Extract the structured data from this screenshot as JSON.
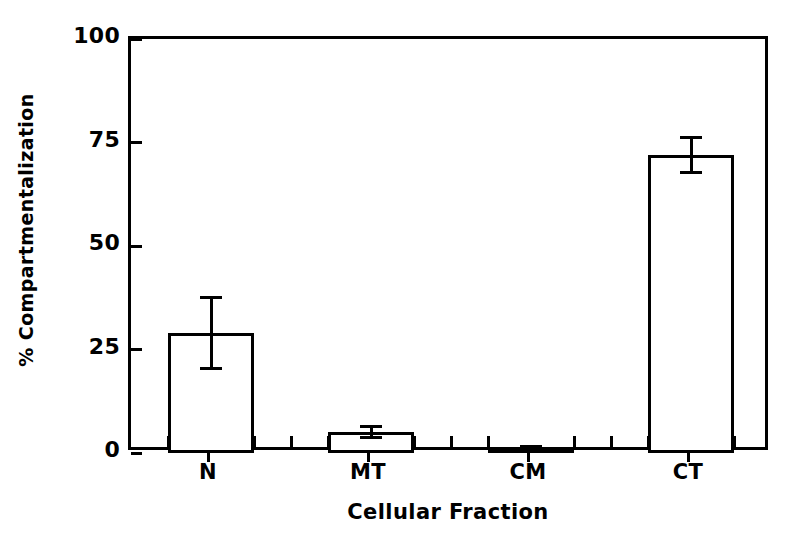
{
  "chart_data": {
    "type": "bar",
    "title": "",
    "subtitle": "",
    "xlabel": "Cellular Fraction",
    "ylabel": "% Compartmentalization",
    "categories": [
      "N",
      "MT",
      "CM",
      "CT"
    ],
    "values": [
      29,
      5,
      1.4,
      72
    ],
    "errors": [
      9,
      1.7,
      0.5,
      4.5
    ],
    "error_type": "symmetric",
    "ylim": [
      0,
      100
    ],
    "yticks": [
      0,
      25,
      50,
      75,
      100
    ],
    "ytick_labels": [
      "0",
      "25",
      "50",
      "75",
      "100"
    ],
    "xtick_labels": [
      "N",
      "MT",
      "CM",
      "CT"
    ],
    "grid": false,
    "legend": false,
    "legend_position": "none",
    "bar_fill": "#ffffff",
    "bar_edge": "#000000",
    "background": "#ffffff",
    "axis_color": "#000000",
    "series": [
      {
        "name": "Compartmentalization",
        "values": [
          29,
          5,
          1.4,
          72
        ],
        "errors": [
          9,
          1.7,
          0.5,
          4.5
        ]
      }
    ]
  },
  "axes": {
    "y": {
      "title": "% Compartmentalization",
      "ticks": [
        {
          "label": "100",
          "value": 100
        },
        {
          "label": "75",
          "value": 75
        },
        {
          "label": "50",
          "value": 50
        },
        {
          "label": "25",
          "value": 25
        },
        {
          "label": "0",
          "value": 0
        }
      ]
    },
    "x": {
      "title": "Cellular Fraction",
      "ticks": [
        {
          "label": "N",
          "value": 0
        },
        {
          "label": "MT",
          "value": 1
        },
        {
          "label": "CM",
          "value": 2
        },
        {
          "label": "CT",
          "value": 3
        }
      ]
    }
  }
}
